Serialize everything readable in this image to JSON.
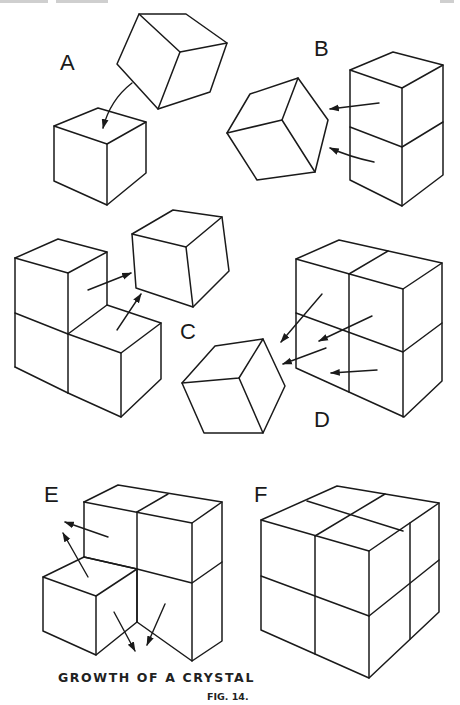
{
  "figure": {
    "title": "GROWTH OF A CRYSTAL",
    "number": "FIG. 14.",
    "panels": [
      {
        "id": "A",
        "label": "A",
        "description": "Single cube rotating toward a lone cube; curved arrow shows attachment on top face"
      },
      {
        "id": "B",
        "label": "B",
        "description": "Rotated cube next to two stacked cubes; two arrows point from the stack toward the loose cube"
      },
      {
        "id": "C",
        "label": "C",
        "description": "L-shaped group of three cubes with two arrows pointing to a free cube"
      },
      {
        "id": "D",
        "label": "D",
        "description": "2x2x1 block of cubes with four arrows pointing toward a rotated cube"
      },
      {
        "id": "E",
        "label": "E",
        "description": "Seven-cube partial block with four arrows showing growth directions"
      },
      {
        "id": "F",
        "label": "F",
        "description": "Complete 2x2x2 crystal cube"
      }
    ]
  },
  "colors": {
    "ink": "#1a1a1a",
    "paper": "#ffffff"
  }
}
